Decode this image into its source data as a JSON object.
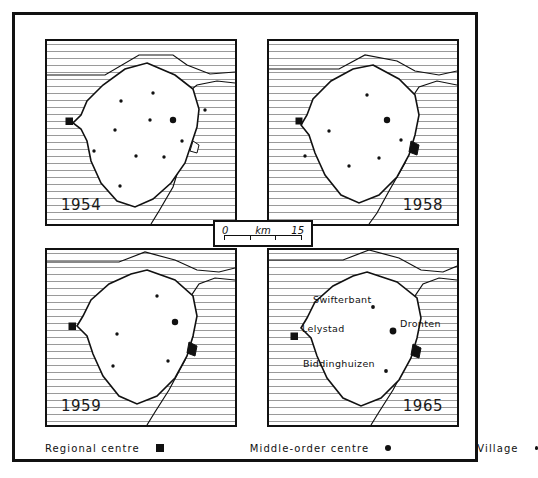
{
  "figure": {
    "title": "",
    "panels": [
      {
        "id": "1954",
        "year": "1954",
        "settlements": {
          "regional_centre": [
            {
              "x": 22,
              "y": 80
            }
          ],
          "middle_order_centre": [
            {
              "x": 126,
              "y": 79
            }
          ],
          "village": [
            {
              "x": 74,
              "y": 60
            },
            {
              "x": 106,
              "y": 52
            },
            {
              "x": 158,
              "y": 69
            },
            {
              "x": 103,
              "y": 79
            },
            {
              "x": 68,
              "y": 89
            },
            {
              "x": 135,
              "y": 100
            },
            {
              "x": 47,
              "y": 110
            },
            {
              "x": 89,
              "y": 115
            },
            {
              "x": 117,
              "y": 116
            },
            {
              "x": 73,
              "y": 145
            }
          ]
        }
      },
      {
        "id": "1958",
        "year": "1958",
        "settlements": {
          "regional_centre": [
            {
              "x": 30,
              "y": 80
            }
          ],
          "middle_order_centre": [
            {
              "x": 118,
              "y": 79
            }
          ],
          "village": [
            {
              "x": 98,
              "y": 54
            },
            {
              "x": 60,
              "y": 90
            },
            {
              "x": 132,
              "y": 99
            },
            {
              "x": 36,
              "y": 115
            },
            {
              "x": 80,
              "y": 125
            },
            {
              "x": 110,
              "y": 117
            }
          ]
        }
      },
      {
        "id": "1959",
        "year": "1959",
        "settlements": {
          "regional_centre": [
            {
              "x": 25,
              "y": 76
            }
          ],
          "middle_order_centre": [
            {
              "x": 128,
              "y": 72
            }
          ],
          "village": [
            {
              "x": 110,
              "y": 46
            },
            {
              "x": 70,
              "y": 84
            },
            {
              "x": 121,
              "y": 111
            },
            {
              "x": 66,
              "y": 116
            }
          ]
        }
      },
      {
        "id": "1965",
        "year": "1965",
        "settlements": {
          "regional_centre": [
            {
              "x": 25,
              "y": 86,
              "name": "Lelystad"
            }
          ],
          "middle_order_centre": [
            {
              "x": 124,
              "y": 81,
              "name": "Dronten"
            }
          ],
          "village": [
            {
              "x": 104,
              "y": 57,
              "name": "Swifterbant"
            },
            {
              "x": 117,
              "y": 121,
              "name": "Biddinghuizen"
            }
          ]
        },
        "labels": [
          {
            "text": "Swifterbant",
            "x": 44,
            "y": 50
          },
          {
            "text": "Lelystad",
            "x": 33,
            "y": 79
          },
          {
            "text": "Dronten",
            "x": 131,
            "y": 74
          },
          {
            "text": "Biddinghuizen",
            "x": 34,
            "y": 114
          }
        ]
      }
    ]
  },
  "scale": {
    "start": "0",
    "unit": "km",
    "end": "15"
  },
  "legend": {
    "regional": {
      "label": "Regional  centre",
      "symbol": "filled-square"
    },
    "middle": {
      "label": "Middle-order  centre",
      "symbol": "filled-circle-medium"
    },
    "village": {
      "label": "Village",
      "symbol": "filled-circle-small"
    }
  },
  "colors": {
    "ink": "#111111",
    "hatch": "#aaaaaa",
    "paper": "#ffffff"
  }
}
